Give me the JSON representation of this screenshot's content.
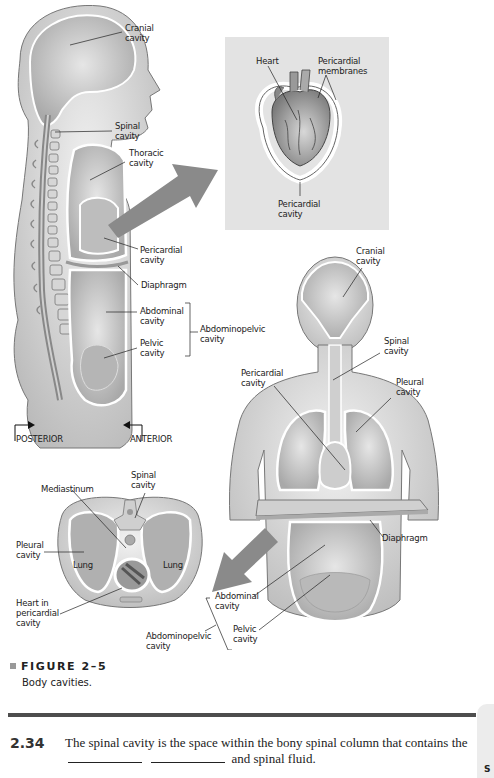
{
  "figure": {
    "number": "FIGURE 2–5",
    "caption": "Body cavities.",
    "side_view": {
      "labels": {
        "cranial": "Cranial\ncavity",
        "spinal": "Spinal\ncavity",
        "thoracic": "Thoracic\ncavity",
        "pericardial": "Pericardial\ncavity",
        "diaphragm": "Diaphragm",
        "abdominal": "Abdominal\ncavity",
        "pelvic": "Pelvic\ncavity",
        "abdominopelvic": "Abdominopelvic\ncavity",
        "posterior": "POSTERIOR",
        "anterior": "ANTERIOR"
      }
    },
    "heart_inset": {
      "labels": {
        "heart": "Heart",
        "membranes": "Pericardial\nmembranes",
        "cavity": "Pericardial\ncavity"
      }
    },
    "front_view": {
      "labels": {
        "cranial": "Cranial\ncavity",
        "spinal": "Spinal\ncavity",
        "pericardial": "Pericardial\ncavity",
        "pleural": "Pleural\ncavity",
        "diaphragm": "Diaphragm",
        "abdominal": "Abdominal\ncavity",
        "pelvic": "Pelvic\ncavity",
        "abdominopelvic": "Abdominopelvic\ncavity"
      }
    },
    "cross_section": {
      "labels": {
        "spinal": "Spinal\ncavity",
        "mediastinum": "Mediastinum",
        "pleural": "Pleural\ncavity",
        "lung_left": "Lung",
        "lung_right": "Lung",
        "heart": "Heart in\npericardial\ncavity"
      }
    }
  },
  "question": {
    "number": "2.34",
    "text_before": "The spinal cavity is the space within the bony spinal column that contains the",
    "text_after": "and spinal fluid."
  },
  "side_tab": {
    "letter": "S"
  }
}
